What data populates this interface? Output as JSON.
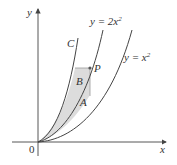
{
  "figure": {
    "axes": {
      "x_label": "x",
      "y_label": "y",
      "origin_label": "0"
    },
    "curves": [
      {
        "id": "C",
        "label": "C"
      },
      {
        "id": "y2x2",
        "label_prefix": "y = 2x",
        "label_exp": "2"
      },
      {
        "id": "yx2",
        "label_prefix": "y = x",
        "label_exp": "2"
      }
    ],
    "regions": [
      {
        "label": "B",
        "description": "region between curve C and y = 2x^2"
      },
      {
        "label": "A",
        "description": "region between y = 2x^2 and y = x^2"
      }
    ],
    "point": {
      "label": "P"
    },
    "colors": {
      "curve": "#444444",
      "shade": "#d9d9d9",
      "axis": "#444444",
      "point": "#555555"
    }
  }
}
